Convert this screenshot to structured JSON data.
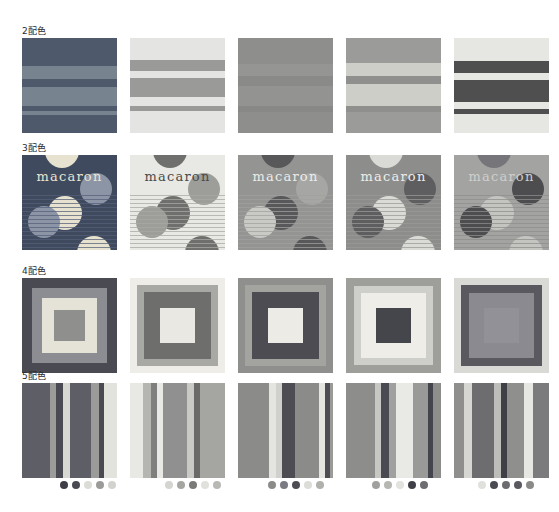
{
  "page": {
    "background": "#ffffff",
    "width": 559,
    "height": 512
  },
  "rows": [
    {
      "label": "2配色",
      "label_y": 24,
      "top": 38,
      "type": "horizontal-bands",
      "swatches": [
        {
          "name": "swatch-2color-1",
          "base": "#4e5a6b",
          "bands": [
            {
              "top": 0,
              "height": 28,
              "color": "#4e5a6b"
            },
            {
              "top": 28,
              "height": 13,
              "color": "#77838f"
            },
            {
              "top": 41,
              "height": 8,
              "color": "#4e5a6b"
            },
            {
              "top": 49,
              "height": 19,
              "color": "#77838f"
            },
            {
              "top": 68,
              "height": 5,
              "color": "#4e5a6b"
            },
            {
              "top": 73,
              "height": 4,
              "color": "#77838f"
            },
            {
              "top": 77,
              "height": 18,
              "color": "#4e5a6b"
            }
          ]
        },
        {
          "name": "swatch-2color-2",
          "base": "#e4e4e2",
          "bands": [
            {
              "top": 0,
              "height": 22,
              "color": "#e4e4e2"
            },
            {
              "top": 22,
              "height": 11,
              "color": "#9a9a98"
            },
            {
              "top": 33,
              "height": 7,
              "color": "#e4e4e2"
            },
            {
              "top": 40,
              "height": 19,
              "color": "#9a9a98"
            },
            {
              "top": 59,
              "height": 9,
              "color": "#e4e4e2"
            },
            {
              "top": 68,
              "height": 5,
              "color": "#9a9a98"
            },
            {
              "top": 73,
              "height": 22,
              "color": "#e4e4e2"
            }
          ]
        },
        {
          "name": "swatch-2color-3",
          "base": "#8e8e8c",
          "bands": [
            {
              "top": 0,
              "height": 26,
              "color": "#8e8e8c"
            },
            {
              "top": 26,
              "height": 12,
              "color": "#959593"
            },
            {
              "top": 38,
              "height": 10,
              "color": "#8a8a88"
            },
            {
              "top": 48,
              "height": 20,
              "color": "#939391"
            },
            {
              "top": 68,
              "height": 6,
              "color": "#888886"
            },
            {
              "top": 74,
              "height": 21,
              "color": "#8e8e8c"
            }
          ]
        },
        {
          "name": "swatch-2color-4",
          "base": "#9b9b99",
          "bands": [
            {
              "top": 0,
              "height": 25,
              "color": "#9b9b99"
            },
            {
              "top": 25,
              "height": 13,
              "color": "#cecec9"
            },
            {
              "top": 38,
              "height": 8,
              "color": "#8f8f8d"
            },
            {
              "top": 46,
              "height": 22,
              "color": "#cecec9"
            },
            {
              "top": 68,
              "height": 6,
              "color": "#8f8f8d"
            },
            {
              "top": 74,
              "height": 21,
              "color": "#9b9b99"
            }
          ]
        },
        {
          "name": "swatch-2color-5",
          "base": "#e6e6e3",
          "bands": [
            {
              "top": 0,
              "height": 23,
              "color": "#e6e6e3"
            },
            {
              "top": 23,
              "height": 12,
              "color": "#4f4f4f"
            },
            {
              "top": 35,
              "height": 7,
              "color": "#e6e6e3"
            },
            {
              "top": 42,
              "height": 22,
              "color": "#4f4f4f"
            },
            {
              "top": 64,
              "height": 7,
              "color": "#e6e6e3"
            },
            {
              "top": 71,
              "height": 5,
              "color": "#4f4f4f"
            },
            {
              "top": 76,
              "height": 19,
              "color": "#e6e6e3"
            }
          ]
        }
      ]
    },
    {
      "label": "3配色",
      "label_y": 141,
      "top": 155,
      "type": "macaron-circles",
      "text": "macaron",
      "swatches": [
        {
          "name": "swatch-3color-1",
          "base": "#3f4a5e",
          "text_color": "#e9e4d4",
          "line_color": "#55607a",
          "circles": [
            {
              "cx": 40,
              "cy": -4,
              "r": 17,
              "color": "#e6e2cf",
              "dotted": false
            },
            {
              "cx": 74,
              "cy": 34,
              "r": 16,
              "color": "#8b95a6",
              "dotted": false
            },
            {
              "cx": 43,
              "cy": 58,
              "r": 17,
              "color": "#e6e2cf",
              "dotted": true,
              "dot_color": "#3f4a5e"
            },
            {
              "cx": 22,
              "cy": 67,
              "r": 16,
              "color": "#8b95a6",
              "dotted": false
            },
            {
              "cx": 72,
              "cy": 98,
              "r": 17,
              "color": "#e6e2cf",
              "dotted": false
            }
          ]
        },
        {
          "name": "swatch-3color-2",
          "base": "#e8e8e4",
          "text_color": "#4a4a4a",
          "line_color": "#a8a8a4",
          "circles": [
            {
              "cx": 40,
              "cy": -4,
              "r": 17,
              "color": "#6f6f6d",
              "dotted": false
            },
            {
              "cx": 74,
              "cy": 34,
              "r": 16,
              "color": "#9d9d9a",
              "dotted": false
            },
            {
              "cx": 43,
              "cy": 58,
              "r": 17,
              "color": "#6f6f6d",
              "dotted": true,
              "dot_color": "#e8e8e4"
            },
            {
              "cx": 22,
              "cy": 67,
              "r": 16,
              "color": "#9d9d9a",
              "dotted": false
            },
            {
              "cx": 72,
              "cy": 98,
              "r": 17,
              "color": "#6f6f6d",
              "dotted": false
            }
          ]
        },
        {
          "name": "swatch-3color-3",
          "base": "#949492",
          "text_color": "#ececea",
          "line_color": "#a0a09e",
          "circles": [
            {
              "cx": 40,
              "cy": -4,
              "r": 17,
              "color": "#58585a",
              "dotted": false
            },
            {
              "cx": 74,
              "cy": 34,
              "r": 16,
              "color": "#a6a6a4",
              "dotted": false
            },
            {
              "cx": 43,
              "cy": 58,
              "r": 17,
              "color": "#58585a",
              "dotted": true,
              "dot_color": "#c9c9c6"
            },
            {
              "cx": 22,
              "cy": 67,
              "r": 16,
              "color": "#c9c9c6",
              "dotted": false
            },
            {
              "cx": 72,
              "cy": 98,
              "r": 17,
              "color": "#58585a",
              "dotted": false
            }
          ]
        },
        {
          "name": "swatch-3color-4",
          "base": "#8d8d8b",
          "text_color": "#ededeb",
          "line_color": "#999997",
          "circles": [
            {
              "cx": 40,
              "cy": -4,
              "r": 17,
              "color": "#dadad6",
              "dotted": false
            },
            {
              "cx": 74,
              "cy": 34,
              "r": 16,
              "color": "#5e5e60",
              "dotted": false
            },
            {
              "cx": 43,
              "cy": 58,
              "r": 17,
              "color": "#dadad6",
              "dotted": true,
              "dot_color": "#6a6a6c"
            },
            {
              "cx": 22,
              "cy": 67,
              "r": 16,
              "color": "#5e5e60",
              "dotted": false
            },
            {
              "cx": 72,
              "cy": 98,
              "r": 17,
              "color": "#dadad6",
              "dotted": false
            }
          ]
        },
        {
          "name": "swatch-3color-5",
          "base": "#a3a3a1",
          "text_color": "#cfcfcd",
          "line_color": "#8e8e8c",
          "circles": [
            {
              "cx": 40,
              "cy": -4,
              "r": 17,
              "color": "#76767a",
              "dotted": false
            },
            {
              "cx": 74,
              "cy": 34,
              "r": 16,
              "color": "#4d4d50",
              "dotted": false
            },
            {
              "cx": 43,
              "cy": 58,
              "r": 17,
              "color": "#c4c4c0",
              "dotted": true,
              "dot_color": "#7c7c7e"
            },
            {
              "cx": 22,
              "cy": 67,
              "r": 16,
              "color": "#4d4d50",
              "dotted": false
            },
            {
              "cx": 72,
              "cy": 98,
              "r": 17,
              "color": "#c4c4c0",
              "dotted": false
            }
          ]
        }
      ]
    },
    {
      "label": "4配色",
      "label_y": 264,
      "top": 278,
      "type": "nested-squares",
      "swatches": [
        {
          "name": "swatch-4color-1",
          "layers": [
            {
              "inset": 0,
              "color": "#4a4a52"
            },
            {
              "inset": 10,
              "color": "#8c8c93"
            },
            {
              "inset": 20,
              "color": "#e5e3d8"
            },
            {
              "inset": 32,
              "color": "#8f8f8d"
            }
          ]
        },
        {
          "name": "swatch-4color-2",
          "layers": [
            {
              "inset": 0,
              "color": "#eeede8"
            },
            {
              "inset": 7,
              "color": "#a8a8a5"
            },
            {
              "inset": 14,
              "color": "#6e6e6c"
            },
            {
              "inset": 30,
              "color": "#e9e8e2"
            }
          ]
        },
        {
          "name": "swatch-4color-3",
          "layers": [
            {
              "inset": 0,
              "color": "#8f8f8d"
            },
            {
              "inset": 7,
              "color": "#a3a3a0"
            },
            {
              "inset": 14,
              "color": "#4c4c52"
            },
            {
              "inset": 30,
              "color": "#ecebe6"
            }
          ]
        },
        {
          "name": "swatch-4color-4",
          "layers": [
            {
              "inset": 0,
              "color": "#9e9e9b"
            },
            {
              "inset": 8,
              "color": "#cececa"
            },
            {
              "inset": 15,
              "color": "#eeede8"
            },
            {
              "inset": 30,
              "color": "#45454c"
            }
          ]
        },
        {
          "name": "swatch-4color-5",
          "layers": [
            {
              "inset": 0,
              "color": "#d9d9d5"
            },
            {
              "inset": 7,
              "color": "#59595f"
            },
            {
              "inset": 15,
              "color": "#8a8a90"
            },
            {
              "inset": 30,
              "color": "#919197"
            }
          ]
        }
      ]
    },
    {
      "label": "5配色",
      "label_y": 369,
      "top": 383,
      "type": "vertical-stripes",
      "swatches": [
        {
          "name": "swatch-5color-1",
          "stripes": [
            {
              "width": 28,
              "color": "#5e5e66"
            },
            {
              "width": 6,
              "color": "#9b9b99"
            },
            {
              "width": 7,
              "color": "#4a4a52"
            },
            {
              "width": 7,
              "color": "#d8d8d3"
            },
            {
              "width": 21,
              "color": "#5e5e66"
            },
            {
              "width": 8,
              "color": "#9b9b99"
            },
            {
              "width": 5,
              "color": "#4a4a52"
            },
            {
              "width": 13,
              "color": "#e3e3de"
            }
          ],
          "dots": [
            {
              "color": "#3e3e46"
            },
            {
              "color": "#4a4a52"
            },
            {
              "color": "#dcdcd7"
            },
            {
              "color": "#9b9b99"
            },
            {
              "color": "#d2d2ce"
            }
          ],
          "dots_left": 60,
          "dots_top": 480
        },
        {
          "name": "swatch-5color-2",
          "stripes": [
            {
              "width": 13,
              "color": "#e8e8e4"
            },
            {
              "width": 8,
              "color": "#b5b5b2"
            },
            {
              "width": 6,
              "color": "#7f7f7d"
            },
            {
              "width": 6,
              "color": "#e8e8e4"
            },
            {
              "width": 24,
              "color": "#909090"
            },
            {
              "width": 7,
              "color": "#c9c9c5"
            },
            {
              "width": 6,
              "color": "#6a6a68"
            },
            {
              "width": 25,
              "color": "#a5a5a2"
            }
          ],
          "dots": [
            {
              "color": "#d4d4d0"
            },
            {
              "color": "#a5a5a2"
            },
            {
              "color": "#7a7a78"
            },
            {
              "color": "#e0e0dc"
            },
            {
              "color": "#b8b8b5"
            }
          ],
          "dots_left": 165,
          "dots_top": 480
        },
        {
          "name": "swatch-5color-3",
          "stripes": [
            {
              "width": 31,
              "color": "#8b8b89"
            },
            {
              "width": 7,
              "color": "#e4e4e0"
            },
            {
              "width": 6,
              "color": "#d0d0cc"
            },
            {
              "width": 13,
              "color": "#4c4c52"
            },
            {
              "width": 24,
              "color": "#8b8b89"
            },
            {
              "width": 6,
              "color": "#e4e4e0"
            },
            {
              "width": 5,
              "color": "#4c4c52"
            },
            {
              "width": 3,
              "color": "#9a9a98"
            }
          ],
          "dots": [
            {
              "color": "#8b8b89"
            },
            {
              "color": "#7a7a82"
            },
            {
              "color": "#4c4c52"
            },
            {
              "color": "#dcdcd8"
            },
            {
              "color": "#b0b0ad"
            }
          ],
          "dots_left": 268,
          "dots_top": 480
        },
        {
          "name": "swatch-5color-4",
          "stripes": [
            {
              "width": 29,
              "color": "#8d8d8b"
            },
            {
              "width": 6,
              "color": "#c7c7c3"
            },
            {
              "width": 8,
              "color": "#4a4a52"
            },
            {
              "width": 7,
              "color": "#a0a09e"
            },
            {
              "width": 17,
              "color": "#e9e9e5"
            },
            {
              "width": 15,
              "color": "#9a9a98"
            },
            {
              "width": 5,
              "color": "#44444c"
            },
            {
              "width": 8,
              "color": "#8d8d8b"
            }
          ],
          "dots": [
            {
              "color": "#a0a09e"
            },
            {
              "color": "#b6b6b3"
            },
            {
              "color": "#e2e2de"
            },
            {
              "color": "#3f3f47"
            },
            {
              "color": "#6e6e72"
            }
          ],
          "dots_left": 372,
          "dots_top": 480
        },
        {
          "name": "swatch-5color-5",
          "stripes": [
            {
              "width": 10,
              "color": "#8f8f8d"
            },
            {
              "width": 8,
              "color": "#d6d6d2"
            },
            {
              "width": 22,
              "color": "#6d6d70"
            },
            {
              "width": 7,
              "color": "#bdbdba"
            },
            {
              "width": 6,
              "color": "#3f3f47"
            },
            {
              "width": 17,
              "color": "#8f8f8d"
            },
            {
              "width": 9,
              "color": "#e6e6e2"
            },
            {
              "width": 16,
              "color": "#7b7b7e"
            }
          ],
          "dots": [
            {
              "color": "#e0e0dc"
            },
            {
              "color": "#4a4a52"
            },
            {
              "color": "#6d6d70"
            },
            {
              "color": "#59595f"
            },
            {
              "color": "#8a8a88"
            }
          ],
          "dots_left": 478,
          "dots_top": 480
        }
      ]
    }
  ]
}
